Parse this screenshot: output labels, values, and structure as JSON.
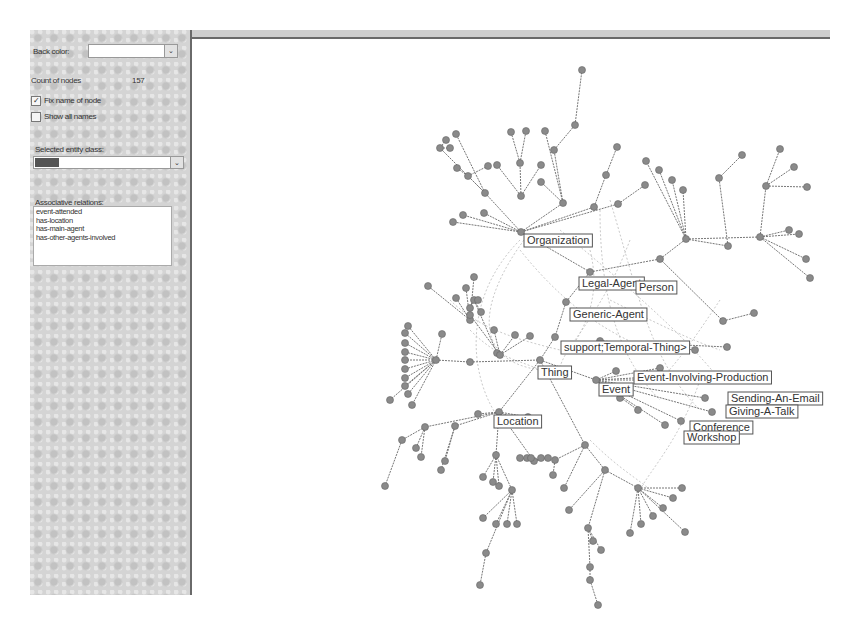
{
  "panel": {
    "back_color_label": "Back color:",
    "back_color_value": "",
    "count_label": "Count of nodes",
    "count_value": "157",
    "fix_name_label": "Fix name of node",
    "fix_name_checked": true,
    "show_all_label": "Show all names",
    "show_all_checked": false,
    "entity_class_label": "Selected entity class:",
    "entity_class_value": "Event",
    "assoc_label": "Associative relations:",
    "assoc_items": [
      "event-attended",
      "has-location",
      "has-main-agent",
      "has-other-agents-involved"
    ],
    "dropdown_glyph": "⌄",
    "check_glyph": "✓"
  },
  "graph": {
    "labels": [
      {
        "text": "Organization",
        "x": 524,
        "y": 234
      },
      {
        "text": "Legal-Agent",
        "x": 579,
        "y": 277
      },
      {
        "text": "Person",
        "x": 636,
        "y": 281
      },
      {
        "text": "Generic-Agent",
        "x": 570,
        "y": 308
      },
      {
        "text": "support;Temporal-Thing>",
        "x": 561,
        "y": 341
      },
      {
        "text": "Thing",
        "x": 538,
        "y": 366
      },
      {
        "text": "Event-Involving-Production",
        "x": 634,
        "y": 371
      },
      {
        "text": "Event",
        "x": 599,
        "y": 383
      },
      {
        "text": "Sending-An-Email",
        "x": 728,
        "y": 392
      },
      {
        "text": "Giving-A-Talk",
        "x": 726,
        "y": 405
      },
      {
        "text": "Location",
        "x": 494,
        "y": 415
      },
      {
        "text": "Conference",
        "x": 690,
        "y": 421
      },
      {
        "text": "Workshop",
        "x": 684,
        "y": 431
      }
    ],
    "node_color": "#8a8a8a",
    "edge_color": "#777777"
  }
}
